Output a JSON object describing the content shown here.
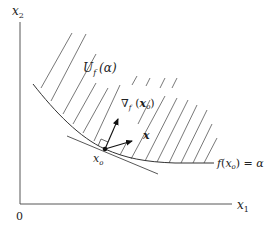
{
  "diagram": {
    "axes": {
      "x_label": "x",
      "x_sub": "1",
      "y_label": "x",
      "y_sub": "2",
      "origin_label": "0"
    },
    "region_label": {
      "main": "U",
      "sub": "f",
      "arg": "(α)"
    },
    "gradient_label": {
      "main": "∇",
      "sub": "f",
      "arg_open": "(",
      "arg_var": "x",
      "arg_sub": "o",
      "arg_close": ")"
    },
    "vector_label": "x",
    "point_label": {
      "main": "x",
      "sub": "o"
    },
    "contour_label": {
      "f": "f",
      "open": "(",
      "var": "x",
      "sub": "o",
      "close": ")",
      "eq": " = α"
    },
    "colors": {
      "line": "#333333",
      "hatch": "#555555",
      "background": "#ffffff"
    }
  }
}
